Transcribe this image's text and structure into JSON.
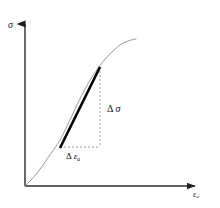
{
  "figure": {
    "background_color": "#ffffff",
    "width": 220,
    "height": 208
  },
  "axes": {
    "y_label": "σ",
    "y_label_name": "stress-sigma",
    "x_label_base": "ε",
    "x_label_subscript": "a",
    "x_label_name": "axial-strain-epsilon-a",
    "axis_color": "#2b2b2b",
    "origin": {
      "x": 25,
      "y": 186
    },
    "y_axis_top": {
      "x": 25,
      "y": 18
    },
    "x_axis_right": {
      "x": 202,
      "y": 186
    }
  },
  "curve": {
    "name": "stress-strain-curve",
    "color": "#9a9a9a",
    "stroke_width": 1.0,
    "shape": "sigmoid",
    "points": [
      {
        "x": 25,
        "y": 186
      },
      {
        "x": 31,
        "y": 180
      },
      {
        "x": 38,
        "y": 172
      },
      {
        "x": 45,
        "y": 162
      },
      {
        "x": 52,
        "y": 152
      },
      {
        "x": 60,
        "y": 140
      },
      {
        "x": 68,
        "y": 124
      },
      {
        "x": 76,
        "y": 107
      },
      {
        "x": 84,
        "y": 91
      },
      {
        "x": 92,
        "y": 77
      },
      {
        "x": 99,
        "y": 67
      },
      {
        "x": 106,
        "y": 58
      },
      {
        "x": 113,
        "y": 51
      },
      {
        "x": 120,
        "y": 45
      },
      {
        "x": 128,
        "y": 41
      },
      {
        "x": 136,
        "y": 39
      }
    ]
  },
  "tangent_line": {
    "name": "tangent-modulus-line",
    "color": "#000000",
    "stroke_width": 2.6,
    "start": {
      "x": 60,
      "y": 148
    },
    "end": {
      "x": 100,
      "y": 67
    }
  },
  "construction": {
    "dashed_color": "#8c8c8c",
    "dash_pattern": "2,2",
    "horizontal_run": {
      "name": "delta-epsilon-dashed-line",
      "from": {
        "x": 60,
        "y": 147
      },
      "to": {
        "x": 100,
        "y": 147
      }
    },
    "vertical_rise": {
      "name": "delta-sigma-dashed-line",
      "from": {
        "x": 100,
        "y": 67
      },
      "to": {
        "x": 100,
        "y": 147
      }
    }
  },
  "annotations": {
    "delta_sigma": {
      "delta": "Δ",
      "symbol": "σ",
      "name": "delta-sigma-label"
    },
    "delta_epsilon": {
      "delta": "Δ",
      "symbol": "ε",
      "subscript": "a",
      "name": "delta-epsilon-label"
    }
  }
}
